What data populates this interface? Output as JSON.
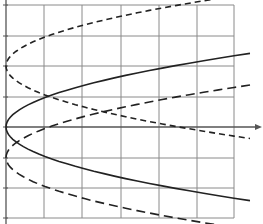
{
  "chart_data": {
    "type": "line",
    "title": "",
    "xlabel": "",
    "ylabel": "",
    "grid": true,
    "legend": null,
    "axes": {
      "origin_px": [
        6,
        127
      ],
      "x_axis_arrow": true,
      "cell_px": [
        38,
        30.5
      ],
      "vertical_gridlines_px": [
        6,
        44,
        82,
        121,
        159,
        197,
        234
      ],
      "horizontal_gridlines_px": [
        5,
        36,
        66,
        97,
        127,
        158,
        188,
        218
      ],
      "x_range_cells": [
        0,
        6.4
      ],
      "y_range_cells": [
        -3,
        4
      ]
    },
    "series": [
      {
        "name": "solid-parabola",
        "style": "solid",
        "vertex_cells": [
          0,
          0
        ],
        "points_cells": [
          [
            0,
            0
          ],
          [
            1,
            0.95
          ],
          [
            2,
            1.35
          ],
          [
            3,
            1.65
          ],
          [
            4,
            1.9
          ],
          [
            5,
            2.15
          ],
          [
            6.4,
            2.4
          ],
          [
            1,
            -0.95
          ],
          [
            2,
            -1.35
          ],
          [
            3,
            -1.65
          ],
          [
            4,
            -1.9
          ],
          [
            5,
            -2.15
          ],
          [
            6.4,
            -2.4
          ]
        ]
      },
      {
        "name": "long-dash-parabola",
        "style": "long-dash",
        "vertex_cells": [
          0,
          -1
        ],
        "points_cells": [
          [
            0,
            -1
          ],
          [
            1,
            -0.05
          ],
          [
            2,
            0.35
          ],
          [
            3,
            0.65
          ],
          [
            4,
            0.9
          ],
          [
            5,
            1.15
          ],
          [
            6.4,
            1.3
          ],
          [
            1,
            -1.95
          ],
          [
            2,
            -2.35
          ],
          [
            3,
            -2.65
          ],
          [
            4,
            -2.9
          ],
          [
            5,
            -3.15
          ],
          [
            6.4,
            -3.1
          ]
        ]
      },
      {
        "name": "short-dash-parabola",
        "style": "short-dash",
        "vertex_cells": [
          0,
          2
        ],
        "points_cells": [
          [
            0,
            2
          ],
          [
            1,
            2.95
          ],
          [
            2,
            3.35
          ],
          [
            3,
            3.65
          ],
          [
            4,
            3.9
          ],
          [
            5,
            4.15
          ],
          [
            6.4,
            4.2
          ],
          [
            1,
            1.05
          ],
          [
            2,
            0.65
          ],
          [
            3,
            0.35
          ],
          [
            4,
            0.1
          ],
          [
            5,
            -0.15
          ],
          [
            6.4,
            -0.2
          ]
        ]
      }
    ]
  },
  "colors": {
    "grid": "#8a8a8a",
    "axis": "#555555",
    "curve": "#222222",
    "background": "#ffffff"
  }
}
